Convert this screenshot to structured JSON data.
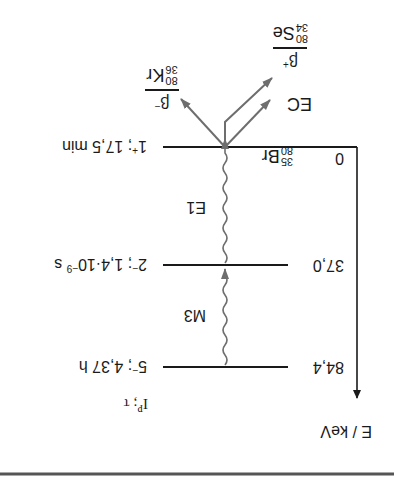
{
  "diagram": {
    "orientation": "rotated-180deg",
    "axis_label": "E / keV",
    "header_label": "I^P; τ",
    "header_parts": {
      "base": "I",
      "sup": "P",
      "rest": "; τ"
    },
    "parent_nucleus": {
      "mass": "80",
      "charge": "35",
      "symbol": "Br"
    },
    "levels": [
      {
        "energy": "0",
        "spin_parity": "1",
        "parity_sign": "+",
        "halflife": "17,5 min"
      },
      {
        "energy": "37,0",
        "spin_parity": "2",
        "parity_sign": "−",
        "halflife_mantissa": "1,4·10",
        "halflife_exp": "−9",
        "halflife_unit": "s"
      },
      {
        "energy": "84,4",
        "spin_parity": "5",
        "parity_sign": "−",
        "halflife": "4,37 h"
      }
    ],
    "transitions": [
      {
        "type": "gamma",
        "label": "M3",
        "from": "84,4",
        "to": "37,0"
      },
      {
        "type": "gamma",
        "label": "E1",
        "from": "37,0",
        "to": "0"
      }
    ],
    "decays": [
      {
        "mode": "β",
        "sign": "−",
        "daughter": {
          "mass": "80",
          "charge": "36",
          "symbol": "Kr"
        }
      },
      {
        "mode": "β",
        "sign": "+",
        "daughter": {
          "mass": "80",
          "charge": "34",
          "symbol": "Se"
        }
      },
      {
        "mode": "EC",
        "label": "EC"
      }
    ],
    "colors": {
      "line": "#1a1a1a",
      "arrow": "#6e6e6e",
      "rule": "#555555"
    }
  }
}
